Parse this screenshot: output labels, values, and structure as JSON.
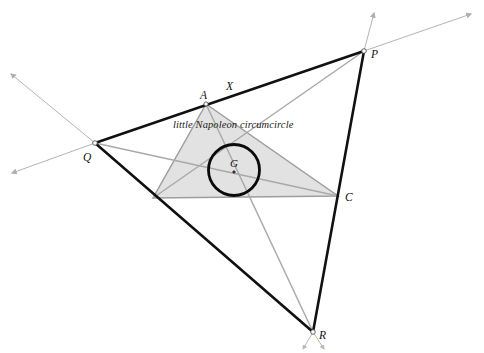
{
  "figure": {
    "width": 484,
    "height": 353,
    "background": "#ffffff",
    "caption": "little Napoleon circumcircle",
    "colors": {
      "outer_triangle_stroke": "#111111",
      "inner_triangle_fill": "#e2e2e2",
      "inner_triangle_stroke": "#9a9a9a",
      "cevian_stroke": "#a9a9a9",
      "ray_stroke": "#b4b4b4",
      "circle_stroke": "#0a0a0a",
      "label_color": "#111111",
      "vertex_marker_fill": "#ffffff",
      "vertex_marker_stroke": "#555555"
    },
    "stroke_widths": {
      "outer_triangle": 2.6,
      "inner_triangle": 1.5,
      "cevian": 1.4,
      "ray": 1.0,
      "circle": 2.8
    }
  },
  "points": {
    "P": {
      "label": "P",
      "x": 364,
      "y": 51,
      "label_x": 371,
      "label_y": 56,
      "marker": true
    },
    "Q": {
      "label": "Q",
      "x": 95,
      "y": 143,
      "label_x": 85,
      "label_y": 160,
      "marker": true
    },
    "R": {
      "label": "R",
      "x": 313,
      "y": 332,
      "label_x": 320,
      "label_y": 338,
      "marker": true
    },
    "A": {
      "label": "A",
      "x": 206,
      "y": 104,
      "label_x": 200,
      "label_y": 99,
      "marker": true
    },
    "B": {
      "label": "",
      "x": 153,
      "y": 198,
      "label_x": 145,
      "label_y": 208,
      "marker": false
    },
    "C": {
      "label": "C",
      "x": 338,
      "y": 196,
      "label_x": 346,
      "label_y": 202,
      "marker": false
    },
    "X": {
      "label": "X",
      "x": 231,
      "y": 96,
      "label_x": 226,
      "label_y": 88,
      "marker": false
    },
    "G": {
      "label": "G",
      "x": 234,
      "y": 170,
      "label_x": 230,
      "label_y": 166,
      "marker": true
    }
  },
  "circle": {
    "name": "little-napoleon-circumcircle",
    "cx": 234,
    "cy": 170,
    "r": 25.5
  },
  "caption": {
    "text": "little Napoleon circumcircle",
    "x": 173,
    "y": 125
  },
  "outer_triangle": {
    "name": "triangle-PQR",
    "vertices": [
      "P",
      "Q",
      "R"
    ],
    "path": "M 364 51 L 95 143 L 313 332 Z"
  },
  "inner_triangle": {
    "name": "triangle-ABC",
    "vertices": [
      "A",
      "B",
      "C"
    ],
    "path": "M 206 104 L 153 198 L 338 196 Z"
  },
  "cevians": [
    {
      "name": "cevian-Q-to-C",
      "from": "Q",
      "to": "C",
      "x1": 95,
      "y1": 143,
      "x2": 338,
      "y2": 196
    },
    {
      "name": "cevian-P-to-B",
      "from": "P",
      "to": "B",
      "x1": 364,
      "y1": 51,
      "x2": 153,
      "y2": 198
    },
    {
      "name": "cevian-R-to-A",
      "from": "R",
      "to": "A",
      "x1": 313,
      "y1": 332,
      "x2": 206,
      "y2": 104
    }
  ],
  "rays": [
    {
      "name": "ray-from-P-up",
      "x1": 364,
      "y1": 51,
      "x2": 374,
      "y2": 13
    },
    {
      "name": "ray-from-P-right",
      "x1": 364,
      "y1": 51,
      "x2": 471,
      "y2": 14
    },
    {
      "name": "ray-from-Q-upleft",
      "x1": 95,
      "y1": 143,
      "x2": 11,
      "y2": 74
    },
    {
      "name": "ray-from-Q-downleft",
      "x1": 95,
      "y1": 143,
      "x2": 12,
      "y2": 173
    },
    {
      "name": "ray-from-R-downleft",
      "x1": 313,
      "y1": 332,
      "x2": 305,
      "y2": 348
    },
    {
      "name": "ray-from-R-downright",
      "x1": 313,
      "y1": 332,
      "x2": 322,
      "y2": 348
    }
  ]
}
